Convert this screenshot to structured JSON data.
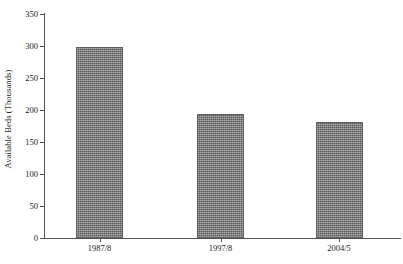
{
  "chart_data": {
    "type": "bar",
    "title": "",
    "xlabel": "",
    "ylabel": "Available Beds (Thousands)",
    "categories": [
      "1987/8",
      "1997/8",
      "2004/5"
    ],
    "values": [
      298,
      193,
      181
    ],
    "series": [
      {
        "name": "Available Beds",
        "values": [
          298,
          193,
          181
        ]
      }
    ],
    "ylim": [
      0,
      350
    ],
    "ytick_values": [
      0,
      50,
      100,
      150,
      200,
      250,
      300,
      350
    ],
    "ytick_labels": [
      "0",
      "50",
      "100",
      "150",
      "200",
      "250",
      "300",
      "350"
    ],
    "grid": false,
    "legend": false,
    "legend_position": "none",
    "bar_color": "#7d7d7d",
    "bar_edge_color": "#5e5e5e",
    "axis_color": "#555555",
    "background_color": "#ffffff"
  }
}
